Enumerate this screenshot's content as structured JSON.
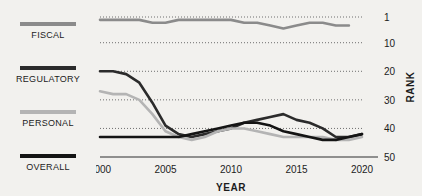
{
  "legend": {
    "items": [
      {
        "label": "FISCAL",
        "color": "#8b8b8b"
      },
      {
        "label": "REGULATORY",
        "color": "#2b2b2b"
      },
      {
        "label": "PERSONAL",
        "color": "#b4b4b4"
      },
      {
        "label": "OVERALL",
        "color": "#141414"
      }
    ]
  },
  "chart_data": {
    "type": "line",
    "title": "",
    "xlabel": "YEAR",
    "ylabel": "RANK",
    "xlim": [
      2000,
      2020
    ],
    "ylim": [
      1,
      50
    ],
    "y_inverted": true,
    "grid": "horizontal-dotted",
    "legend_position": "left-outside",
    "xticks": [
      2000,
      2005,
      2010,
      2015,
      2020
    ],
    "xticklabels": [
      "2000",
      "2005",
      "2010",
      "2015",
      "2020"
    ],
    "yticks": [
      1,
      10,
      20,
      30,
      40,
      50
    ],
    "yticklabels": [
      "1",
      "10",
      "20",
      "30",
      "40",
      "50"
    ],
    "x": [
      2000,
      2001,
      2002,
      2003,
      2004,
      2005,
      2006,
      2007,
      2008,
      2009,
      2010,
      2011,
      2012,
      2013,
      2014,
      2015,
      2016,
      2017,
      2018,
      2019,
      2020
    ],
    "series": [
      {
        "name": "FISCAL",
        "color": "#8b8b8b",
        "values": [
          2,
          2,
          2,
          2,
          3,
          3,
          2,
          2,
          2,
          2,
          2,
          3,
          3,
          4,
          5,
          4,
          3,
          3,
          4,
          4,
          null
        ]
      },
      {
        "name": "REGULATORY",
        "color": "#2b2b2b",
        "values": [
          20,
          20,
          21,
          24,
          31,
          39,
          42,
          43,
          42,
          41,
          40,
          38,
          37,
          36,
          35,
          37,
          38,
          40,
          43,
          43,
          42
        ]
      },
      {
        "name": "PERSONAL",
        "color": "#b4b4b4",
        "values": [
          27,
          28,
          28,
          30,
          35,
          41,
          43,
          44,
          43,
          41,
          40,
          40,
          41,
          42,
          43,
          43,
          43,
          43,
          44,
          44,
          43
        ]
      },
      {
        "name": "OVERALL",
        "color": "#141414",
        "values": [
          43,
          43,
          43,
          43,
          43,
          43,
          43,
          42,
          41,
          40,
          39,
          38,
          38,
          39,
          41,
          42,
          43,
          44,
          44,
          43,
          42
        ]
      }
    ]
  }
}
